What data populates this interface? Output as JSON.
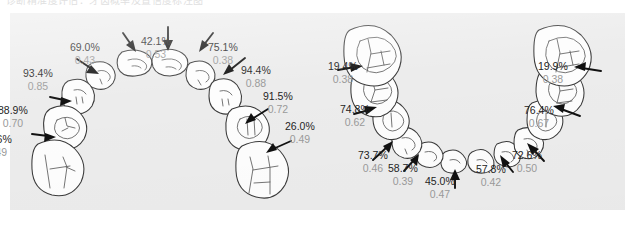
{
  "document": {
    "clipped_heading": "诊断精准度评估：牙齿概率及置信度标注图"
  },
  "figure": {
    "background_color": "#ececec",
    "page_background": "#ffffff",
    "percent_color": "#242424",
    "score_color": "#9a9a9a",
    "tooth_stroke_color": "#3a3a3a",
    "arrow_color": "#111111"
  },
  "arches": [
    {
      "name": "upper-arch",
      "labels": [
        {
          "id": "u-l3",
          "percent": "32.6%",
          "score": "0.49"
        },
        {
          "id": "u-l2",
          "percent": "88.9%",
          "score": "0.70"
        },
        {
          "id": "u-l1",
          "percent": "93.4%",
          "score": "0.85"
        },
        {
          "id": "u-c2",
          "percent": "69.0%",
          "score": "0.43"
        },
        {
          "id": "u-c1",
          "percent": "42.1%",
          "score": "0.53"
        },
        {
          "id": "u-c3",
          "percent": "75.1%",
          "score": "0.38"
        },
        {
          "id": "u-r1",
          "percent": "94.4%",
          "score": "0.88"
        },
        {
          "id": "u-r2",
          "percent": "91.5%",
          "score": "0.72"
        },
        {
          "id": "u-r3",
          "percent": "26.0%",
          "score": "0.49"
        }
      ]
    },
    {
      "name": "lower-arch",
      "labels": [
        {
          "id": "l-l1",
          "percent": "19.4%",
          "score": "0.38"
        },
        {
          "id": "l-l2",
          "percent": "74.8%",
          "score": "0.62"
        },
        {
          "id": "l-l3",
          "percent": "73.7%",
          "score": "0.46"
        },
        {
          "id": "l-c1",
          "percent": "58.7%",
          "score": "0.39"
        },
        {
          "id": "l-c2",
          "percent": "45.0%",
          "score": "0.47"
        },
        {
          "id": "l-c3",
          "percent": "57.8%",
          "score": "0.42"
        },
        {
          "id": "l-r3",
          "percent": "72.6%",
          "score": "0.50"
        },
        {
          "id": "l-r2",
          "percent": "76.4%",
          "score": "0.67"
        },
        {
          "id": "l-r1",
          "percent": "19.9%",
          "score": "0.38"
        }
      ]
    }
  ]
}
